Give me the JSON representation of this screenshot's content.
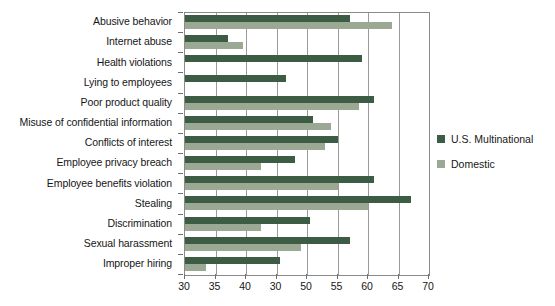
{
  "chart_data": {
    "type": "bar",
    "orientation": "horizontal",
    "title": "",
    "subtitle": "",
    "xlabel": "",
    "ylabel": "",
    "xlim": [
      30,
      70
    ],
    "xticks": [
      30,
      35,
      40,
      45,
      50,
      55,
      60,
      65,
      70
    ],
    "xtick_labels": [
      "30",
      "35",
      "40",
      "30",
      "50",
      "55",
      "60",
      "65",
      "70"
    ],
    "grid": true,
    "legend_position": "right",
    "categories": [
      "Abusive behavior",
      "Internet abuse",
      "Health violations",
      "Lying to employees",
      "Poor product quality",
      "Misuse of confidential information",
      "Conflicts of interest",
      "Employee privacy breach",
      "Employee benefits violation",
      "Stealing",
      "Discrimination",
      "Sexual harassment",
      "Improper hiring"
    ],
    "series": [
      {
        "name": "U.S. Multinational",
        "color": "#3d5c44",
        "values": [
          57,
          37,
          59,
          46.5,
          61,
          51,
          55,
          48,
          61,
          67,
          50.5,
          57,
          45.5
        ]
      },
      {
        "name": "Domestic",
        "color": "#9aa894",
        "values": [
          64,
          39.5,
          30,
          30,
          58.5,
          54,
          53,
          42.5,
          55,
          60,
          42.5,
          49,
          33.5
        ]
      }
    ]
  },
  "legend": {
    "items": [
      {
        "label": "U.S. Multinational",
        "color": "#3d5c44"
      },
      {
        "label": "Domestic",
        "color": "#9aa894"
      }
    ]
  }
}
